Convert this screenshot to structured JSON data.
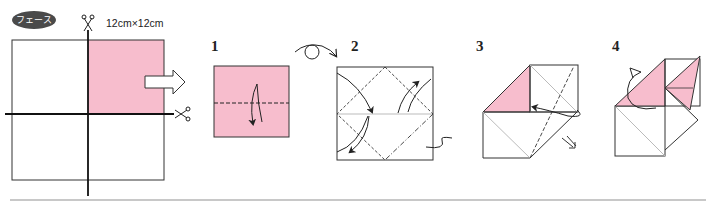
{
  "badge": {
    "label": "フェース"
  },
  "paper_size": {
    "label": "12cm×12cm"
  },
  "colors": {
    "paper_pink": "#f7bdcd",
    "line": "#222222",
    "fold_line_gray": "#bbbbbb",
    "badge_bg": "#4a4a4a",
    "divider": "#c8c8c8"
  },
  "steps": [
    {
      "number": "1",
      "instruction": "valley fold in half downward"
    },
    {
      "number": "2",
      "instruction": "fold corners to center; turn over"
    },
    {
      "number": "3",
      "instruction": "fold behind along dash-dot line"
    },
    {
      "number": "4",
      "instruction": "rotate/turn result"
    }
  ],
  "icons": {
    "cut_top": "scissors-icon",
    "cut_right": "scissors-icon",
    "next": "arrow-right-icon",
    "turn_over": "turn-over-icon"
  }
}
